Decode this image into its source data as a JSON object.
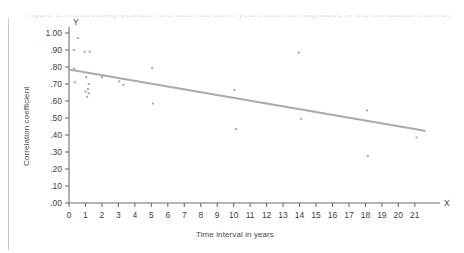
{
  "figure": {
    "caption_ghost": "Figure 3. Relationship between the time interval in years and the magnitude of the correlation coefficient",
    "axis_arrow_labels": {
      "y": "Y",
      "x": "X"
    }
  },
  "chart_data": {
    "type": "scatter",
    "title": "",
    "subtitle": "",
    "xlabel": "Time interval in years",
    "ylabel": "Correlation coefficient",
    "xlim": [
      0,
      21.8
    ],
    "ylim": [
      0.0,
      1.0
    ],
    "grid": false,
    "legend": "none",
    "xticks": [
      "0",
      "1",
      "2",
      "3",
      "4",
      "5",
      "6",
      "7",
      "8",
      "9",
      "10",
      "11",
      "12",
      "13",
      "14",
      "15",
      "16",
      "17",
      "18",
      "19",
      "20",
      "21"
    ],
    "xtick_values": [
      0,
      1,
      2,
      3,
      4,
      5,
      6,
      7,
      8,
      9,
      10,
      11,
      12,
      13,
      14,
      15,
      16,
      17,
      18,
      19,
      20,
      21
    ],
    "yticks": [
      "1.00",
      ".90",
      ".80",
      ".70",
      ".60",
      ".50",
      ".40",
      ".30",
      ".20",
      ".10",
      ".00"
    ],
    "ytick_values": [
      1.0,
      0.9,
      0.8,
      0.7,
      0.6,
      0.5,
      0.4,
      0.3,
      0.2,
      0.1,
      0.0
    ],
    "marker": {
      "shape": "square",
      "size_px": 2,
      "color": "#a8a8a8"
    },
    "points": [
      {
        "x": 0.55,
        "y": 0.97
      },
      {
        "x": 0.3,
        "y": 0.9
      },
      {
        "x": 0.95,
        "y": 0.89
      },
      {
        "x": 1.25,
        "y": 0.89
      },
      {
        "x": 0.3,
        "y": 0.79
      },
      {
        "x": 1.05,
        "y": 0.74
      },
      {
        "x": 2.0,
        "y": 0.74
      },
      {
        "x": 0.35,
        "y": 0.71
      },
      {
        "x": 1.2,
        "y": 0.7
      },
      {
        "x": 1.15,
        "y": 0.67
      },
      {
        "x": 1.0,
        "y": 0.655
      },
      {
        "x": 1.2,
        "y": 0.645
      },
      {
        "x": 1.1,
        "y": 0.625
      },
      {
        "x": 3.05,
        "y": 0.715
      },
      {
        "x": 3.3,
        "y": 0.695
      },
      {
        "x": 5.05,
        "y": 0.795
      },
      {
        "x": 5.1,
        "y": 0.585
      },
      {
        "x": 10.05,
        "y": 0.665
      },
      {
        "x": 10.15,
        "y": 0.435
      },
      {
        "x": 13.95,
        "y": 0.885
      },
      {
        "x": 14.1,
        "y": 0.495
      },
      {
        "x": 18.1,
        "y": 0.545
      },
      {
        "x": 18.15,
        "y": 0.275
      },
      {
        "x": 21.1,
        "y": 0.385
      }
    ],
    "trendline": {
      "kind": "linear-fit",
      "color": "#aaaaaa",
      "width_px": 2,
      "x_start": 0.0,
      "y_start": 0.785,
      "x_end": 21.6,
      "y_end": 0.425
    }
  }
}
